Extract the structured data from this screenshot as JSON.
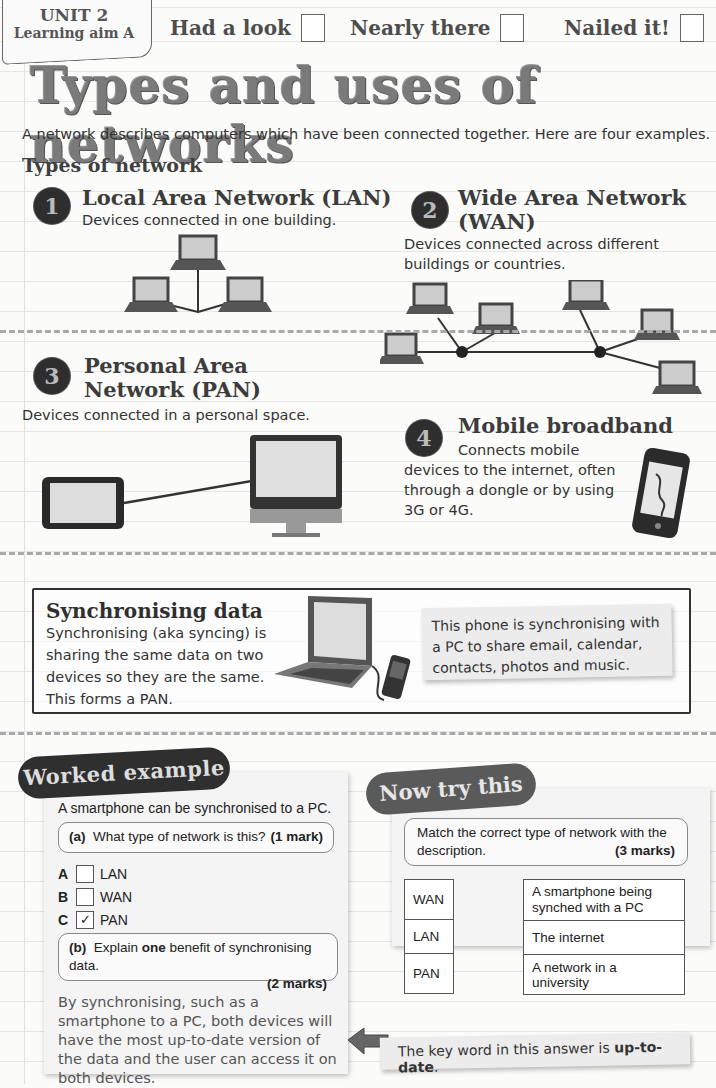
{
  "header": {
    "unit": "UNIT 2",
    "learning_aim": "Learning aim A",
    "progress": [
      {
        "label": "Had a look",
        "checked": false
      },
      {
        "label": "Nearly there",
        "checked": false
      },
      {
        "label": "Nailed it!",
        "checked": false
      }
    ]
  },
  "title": "Types and uses of networks",
  "intro": "A network describes computers which have been connected together. Here are four examples.",
  "types_heading": "Types of network",
  "sections": [
    {
      "number": "1",
      "title": "Local Area Network (LAN)",
      "description": "Devices connected in one building.",
      "icon": "laptop-network-icon"
    },
    {
      "number": "2",
      "title": "Wide Area Network (WAN)",
      "description": "Devices connected across different buildings or countries.",
      "icon": "wide-network-icon"
    },
    {
      "number": "3",
      "title": "Personal Area Network (PAN)",
      "description": "Devices connected in a personal space.",
      "icon": "tablet-monitor-icon"
    },
    {
      "number": "4",
      "title": "Mobile broadband",
      "description": "Connects mobile devices to the internet, often through a dongle or by using 3G or 4G.",
      "icon": "smartphone-icon"
    }
  ],
  "sync": {
    "title": "Synchronising data",
    "description": "Synchronising (aka syncing) is sharing the same data on two devices so they are the same. This forms a PAN.",
    "note": "This phone is synchronising with a PC to share email, calendar, contacts, photos and music."
  },
  "worked_example": {
    "label": "Worked example",
    "question": "A smartphone can be synchronised to a PC.",
    "part_a": {
      "prefix": "(a)",
      "text": "What type of network is this?",
      "marks": "(1 mark)"
    },
    "options": [
      {
        "letter": "A",
        "label": "LAN",
        "checked": false
      },
      {
        "letter": "B",
        "label": "WAN",
        "checked": false
      },
      {
        "letter": "C",
        "label": "PAN",
        "checked": true,
        "mark": "✓"
      }
    ],
    "part_b": {
      "prefix": "(b)",
      "text_before": "Explain ",
      "bold": "one",
      "text_after": " benefit of synchronising data.",
      "marks": "(2 marks)"
    },
    "answer": "By synchronising, such as a smartphone to a PC, both devices will have the most up-to-date version of the data and the user can access it on both devices."
  },
  "now_try_this": {
    "label": "Now try this",
    "instruction": "Match the correct type of network with the description.",
    "marks": "(3 marks)",
    "left_column": [
      "WAN",
      "LAN",
      "PAN"
    ],
    "right_column": [
      "A smartphone being synched with a PC",
      "The internet",
      "A network in a university"
    ]
  },
  "key_note": {
    "text_before": "The key word in this answer is ",
    "bold": "up-to-date",
    "text_after": "."
  },
  "colors": {
    "accent_dark": "#2f2f2f",
    "label_grey": "#5a5a5a",
    "note_bg": "#ececec"
  }
}
